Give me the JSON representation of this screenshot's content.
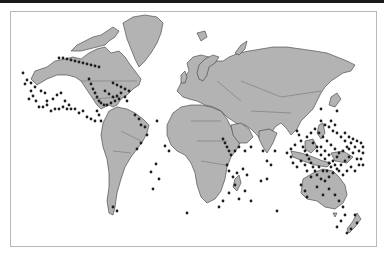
{
  "map": {
    "projection": "Mercator",
    "type": "world point map",
    "colors": {
      "background": "#ffffff",
      "land": "#b3b3b3",
      "coastline": "#3a3a3a",
      "points": "#1e1e1e",
      "frame_border": "#b8b8b8",
      "top_bar": "#1a1a1a"
    },
    "point_clusters": [
      {
        "region": "Hawaii / North Pacific",
        "points": [
          [
            58,
            57
          ],
          [
            62,
            57
          ],
          [
            66,
            58
          ],
          [
            70,
            59
          ],
          [
            74,
            60
          ],
          [
            78,
            61
          ],
          [
            82,
            62
          ],
          [
            86,
            63
          ],
          [
            90,
            64
          ],
          [
            94,
            65
          ],
          [
            98,
            66
          ]
        ]
      },
      {
        "region": "Central Pacific",
        "points": [
          [
            26,
            79
          ],
          [
            30,
            90
          ],
          [
            32,
            95
          ],
          [
            35,
            100
          ],
          [
            22,
            72
          ],
          [
            24,
            83
          ],
          [
            28,
            98
          ],
          [
            38,
            106
          ],
          [
            42,
            106
          ],
          [
            46,
            104
          ],
          [
            50,
            110
          ],
          [
            54,
            108
          ],
          [
            58,
            108
          ],
          [
            62,
            106
          ],
          [
            66,
            108
          ],
          [
            70,
            108
          ],
          [
            74,
            108
          ],
          [
            78,
            112
          ],
          [
            82,
            110
          ],
          [
            86,
            116
          ],
          [
            90,
            118
          ],
          [
            94,
            120
          ],
          [
            46,
            100
          ],
          [
            52,
            98
          ],
          [
            56,
            94
          ],
          [
            60,
            92
          ],
          [
            64,
            100
          ],
          [
            68,
            104
          ],
          [
            30,
            82
          ],
          [
            34,
            86
          ],
          [
            40,
            90
          ],
          [
            44,
            92
          ]
        ]
      },
      {
        "region": "Central America / Caribbean",
        "points": [
          [
            88,
            78
          ],
          [
            90,
            83
          ],
          [
            92,
            88
          ],
          [
            94,
            92
          ],
          [
            96,
            96
          ],
          [
            98,
            100
          ],
          [
            100,
            102
          ],
          [
            103,
            104
          ],
          [
            106,
            104
          ],
          [
            110,
            102
          ],
          [
            114,
            100
          ],
          [
            118,
            98
          ],
          [
            112,
            82
          ],
          [
            116,
            84
          ],
          [
            120,
            86
          ],
          [
            124,
            88
          ],
          [
            128,
            90
          ],
          [
            104,
            90
          ],
          [
            108,
            93
          ],
          [
            112,
            96
          ],
          [
            116,
            95
          ],
          [
            120,
            92
          ],
          [
            124,
            96
          ],
          [
            126,
            100
          ],
          [
            96,
            110
          ],
          [
            98,
            114
          ],
          [
            100,
            120
          ]
        ]
      },
      {
        "region": "Brazil coast",
        "points": [
          [
            134,
            114
          ],
          [
            138,
            118
          ],
          [
            140,
            124
          ],
          [
            144,
            126
          ],
          [
            146,
            134
          ],
          [
            140,
            142
          ],
          [
            136,
            148
          ]
        ]
      },
      {
        "region": "Atlantic islands",
        "points": [
          [
            155,
            163
          ],
          [
            150,
            171
          ],
          [
            158,
            178
          ],
          [
            152,
            188
          ],
          [
            112,
            206
          ],
          [
            116,
            210
          ],
          [
            186,
            212
          ]
        ]
      },
      {
        "region": "West Africa",
        "points": [
          [
            164,
            145
          ],
          [
            168,
            150
          ],
          [
            156,
            120
          ]
        ]
      },
      {
        "region": "Red Sea / Arabia",
        "points": [
          [
            222,
            138
          ],
          [
            224,
            142
          ],
          [
            226,
            146
          ],
          [
            228,
            150
          ],
          [
            230,
            154
          ],
          [
            234,
            150
          ],
          [
            238,
            146
          ],
          [
            244,
            150
          ],
          [
            250,
            146
          ]
        ]
      },
      {
        "region": "East Africa / Indian Ocean",
        "points": [
          [
            226,
            164
          ],
          [
            228,
            170
          ],
          [
            232,
            176
          ],
          [
            236,
            172
          ],
          [
            242,
            168
          ],
          [
            246,
            174
          ],
          [
            234,
            184
          ],
          [
            228,
            192
          ],
          [
            222,
            200
          ],
          [
            218,
            206
          ],
          [
            238,
            198
          ],
          [
            244,
            190
          ],
          [
            250,
            200
          ],
          [
            260,
            180
          ],
          [
            266,
            178
          ]
        ]
      },
      {
        "region": "India / Sri Lanka",
        "points": [
          [
            262,
            150
          ],
          [
            266,
            160
          ],
          [
            270,
            164
          ],
          [
            274,
            150
          ]
        ]
      },
      {
        "region": "Southeast Asia / Coral Triangle",
        "points": [
          [
            296,
            130
          ],
          [
            298,
            134
          ],
          [
            300,
            140
          ],
          [
            302,
            146
          ],
          [
            304,
            150
          ],
          [
            306,
            154
          ],
          [
            308,
            158
          ],
          [
            310,
            162
          ],
          [
            312,
            166
          ],
          [
            314,
            170
          ],
          [
            316,
            174
          ],
          [
            320,
            178
          ],
          [
            324,
            180
          ],
          [
            328,
            176
          ],
          [
            332,
            172
          ],
          [
            336,
            168
          ],
          [
            340,
            164
          ],
          [
            344,
            160
          ],
          [
            348,
            156
          ],
          [
            300,
            160
          ],
          [
            304,
            164
          ],
          [
            296,
            166
          ],
          [
            292,
            162
          ],
          [
            290,
            156
          ],
          [
            286,
            152
          ],
          [
            290,
            148
          ],
          [
            294,
            144
          ],
          [
            306,
            136
          ],
          [
            310,
            132
          ],
          [
            314,
            128
          ],
          [
            318,
            132
          ],
          [
            322,
            136
          ],
          [
            326,
            140
          ],
          [
            330,
            144
          ],
          [
            334,
            148
          ],
          [
            338,
            152
          ],
          [
            342,
            150
          ],
          [
            346,
            146
          ],
          [
            350,
            142
          ],
          [
            354,
            146
          ],
          [
            358,
            150
          ],
          [
            316,
            150
          ],
          [
            320,
            154
          ],
          [
            324,
            158
          ],
          [
            328,
            162
          ],
          [
            332,
            160
          ],
          [
            336,
            156
          ],
          [
            312,
            142
          ],
          [
            316,
            146
          ],
          [
            320,
            146
          ],
          [
            324,
            150
          ],
          [
            328,
            154
          ],
          [
            306,
            170
          ],
          [
            310,
            176
          ],
          [
            318,
            166
          ],
          [
            322,
            170
          ],
          [
            326,
            170
          ],
          [
            330,
            166
          ],
          [
            334,
            164
          ],
          [
            338,
            170
          ],
          [
            342,
            174
          ],
          [
            346,
            170
          ],
          [
            350,
            166
          ],
          [
            354,
            170
          ],
          [
            358,
            164
          ],
          [
            356,
            158
          ],
          [
            352,
            152
          ],
          [
            348,
            148
          ],
          [
            344,
            140
          ],
          [
            340,
            136
          ],
          [
            336,
            132
          ],
          [
            332,
            130
          ],
          [
            328,
            126
          ],
          [
            324,
            124
          ],
          [
            320,
            120
          ]
        ]
      },
      {
        "region": "Micronesia",
        "points": [
          [
            330,
            120
          ],
          [
            334,
            124
          ],
          [
            336,
            110
          ],
          [
            320,
            108
          ],
          [
            344,
            132
          ],
          [
            348,
            136
          ],
          [
            352,
            138
          ],
          [
            356,
            140
          ],
          [
            360,
            142
          ],
          [
            362,
            146
          ],
          [
            362,
            152
          ],
          [
            360,
            158
          ],
          [
            362,
            164
          ]
        ]
      },
      {
        "region": "Australia coast",
        "points": [
          [
            300,
            184
          ],
          [
            304,
            190
          ],
          [
            306,
            196
          ],
          [
            316,
            186
          ],
          [
            322,
            194
          ],
          [
            328,
            188
          ],
          [
            334,
            194
          ],
          [
            338,
            200
          ],
          [
            342,
            206
          ],
          [
            344,
            214
          ],
          [
            340,
            220
          ],
          [
            336,
            226
          ],
          [
            276,
            210
          ]
        ]
      },
      {
        "region": "New Zealand",
        "points": [
          [
            354,
            214
          ],
          [
            356,
            222
          ],
          [
            350,
            228
          ],
          [
            346,
            232
          ]
        ]
      }
    ]
  }
}
